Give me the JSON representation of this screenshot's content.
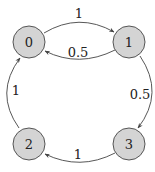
{
  "diagram": {
    "type": "state-transition-graph",
    "nodes": [
      {
        "id": "0",
        "label": "0"
      },
      {
        "id": "1",
        "label": "1"
      },
      {
        "id": "2",
        "label": "2"
      },
      {
        "id": "3",
        "label": "3"
      }
    ],
    "edges": [
      {
        "from": "0",
        "to": "1",
        "label": "1"
      },
      {
        "from": "1",
        "to": "0",
        "label": "0.5"
      },
      {
        "from": "1",
        "to": "3",
        "label": "0.5"
      },
      {
        "from": "3",
        "to": "2",
        "label": "1"
      },
      {
        "from": "2",
        "to": "0",
        "label": "1"
      }
    ],
    "colors": {
      "node_fill": "#d4d4d4",
      "node_stroke": "#555555",
      "edge": "#444444"
    }
  }
}
